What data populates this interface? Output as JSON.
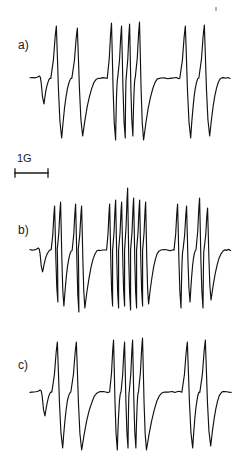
{
  "figure": {
    "type": "epr-derivative-spectra-figure",
    "width": 244,
    "height": 466,
    "background_color": "#ffffff",
    "trace_color": "#111111",
    "panel_count": 3
  },
  "panels": [
    {
      "id": "a",
      "label": "a)",
      "label_x": 18,
      "label_y": 38,
      "plot_top": 14,
      "plot_height": 130,
      "baseline_y": 78
    },
    {
      "id": "b",
      "label": "b)",
      "label_x": 18,
      "label_y": 223,
      "plot_top": 186,
      "plot_height": 128,
      "baseline_y": 250
    },
    {
      "id": "c",
      "label": "c)",
      "label_x": 18,
      "label_y": 358,
      "plot_top": 332,
      "plot_height": 124,
      "baseline_y": 392
    }
  ],
  "scalebar": {
    "label": "1G",
    "x_start": 14,
    "x_end": 47,
    "y": 178,
    "cap_height": 8,
    "color": "#1a1a1a"
  },
  "artifact": {
    "name": "scan-speck",
    "x": 215,
    "y": 7
  },
  "chart_data": {
    "type": "line",
    "title": "",
    "subtitle": "",
    "xlabel": "",
    "ylabel": "",
    "legend": [],
    "grid": false,
    "axis_visible": false,
    "x_units": "gauss",
    "x_scale_reference": {
      "label": "1G",
      "pixels": 33
    },
    "series": [
      {
        "name": "a",
        "panel": "a",
        "baseline_y": 78,
        "x_start": 30,
        "x_end": 232,
        "line_count": 8,
        "lines": [
          {
            "x": 40,
            "up": 2,
            "down": 26,
            "width": 5.5,
            "tail": 10
          },
          {
            "x": 57,
            "up": 52,
            "down": 60,
            "width": 6.5,
            "tail": 13
          },
          {
            "x": 78,
            "up": 50,
            "down": 58,
            "width": 6.5,
            "tail": 16
          },
          {
            "x": 112,
            "up": 55,
            "down": 62,
            "width": 5.0,
            "tail": 7
          },
          {
            "x": 122,
            "up": 52,
            "down": 60,
            "width": 4.5,
            "tail": 6
          },
          {
            "x": 130,
            "up": 54,
            "down": 58,
            "width": 4.0,
            "tail": 6
          },
          {
            "x": 140,
            "up": 56,
            "down": 62,
            "width": 5.0,
            "tail": 16
          },
          {
            "x": 186,
            "up": 52,
            "down": 60,
            "width": 6.5,
            "tail": 14
          },
          {
            "x": 205,
            "up": 53,
            "down": 58,
            "width": 6.5,
            "tail": 12
          }
        ]
      },
      {
        "name": "b",
        "panel": "b",
        "baseline_y": 250,
        "x_start": 30,
        "x_end": 232,
        "line_count": 16,
        "lines": [
          {
            "x": 39,
            "up": 2,
            "down": 22,
            "width": 5.0,
            "tail": 8
          },
          {
            "x": 55,
            "up": 44,
            "down": 52,
            "width": 4.0,
            "tail": 3
          },
          {
            "x": 61,
            "up": 48,
            "down": 56,
            "width": 4.0,
            "tail": 9
          },
          {
            "x": 76,
            "up": 46,
            "down": 62,
            "width": 4.0,
            "tail": 3
          },
          {
            "x": 82,
            "up": 44,
            "down": 58,
            "width": 4.0,
            "tail": 14
          },
          {
            "x": 110,
            "up": 46,
            "down": 56,
            "width": 3.6,
            "tail": 3
          },
          {
            "x": 116,
            "up": 50,
            "down": 58,
            "width": 3.6,
            "tail": 3
          },
          {
            "x": 122,
            "up": 48,
            "down": 56,
            "width": 3.6,
            "tail": 3
          },
          {
            "x": 128,
            "up": 62,
            "down": 60,
            "width": 3.6,
            "tail": 3
          },
          {
            "x": 134,
            "up": 52,
            "down": 58,
            "width": 3.6,
            "tail": 3
          },
          {
            "x": 140,
            "up": 50,
            "down": 56,
            "width": 3.6,
            "tail": 3
          },
          {
            "x": 146,
            "up": 48,
            "down": 54,
            "width": 3.6,
            "tail": 12
          },
          {
            "x": 178,
            "up": 46,
            "down": 58,
            "width": 4.2,
            "tail": 3
          },
          {
            "x": 187,
            "up": 44,
            "down": 52,
            "width": 4.2,
            "tail": 9
          },
          {
            "x": 200,
            "up": 52,
            "down": 58,
            "width": 4.2,
            "tail": 3
          },
          {
            "x": 208,
            "up": 42,
            "down": 50,
            "width": 4.2,
            "tail": 14
          }
        ]
      },
      {
        "name": "c",
        "panel": "c",
        "baseline_y": 392,
        "x_start": 30,
        "x_end": 232,
        "line_count": 8,
        "lines": [
          {
            "x": 41,
            "up": 2,
            "down": 24,
            "width": 5.5,
            "tail": 10
          },
          {
            "x": 58,
            "up": 50,
            "down": 56,
            "width": 6.5,
            "tail": 13
          },
          {
            "x": 77,
            "up": 50,
            "down": 58,
            "width": 6.5,
            "tail": 18
          },
          {
            "x": 114,
            "up": 52,
            "down": 58,
            "width": 4.6,
            "tail": 5
          },
          {
            "x": 125,
            "up": 50,
            "down": 56,
            "width": 4.2,
            "tail": 5
          },
          {
            "x": 133,
            "up": 52,
            "down": 56,
            "width": 4.0,
            "tail": 5
          },
          {
            "x": 143,
            "up": 54,
            "down": 58,
            "width": 4.8,
            "tail": 18
          },
          {
            "x": 188,
            "up": 50,
            "down": 56,
            "width": 6.5,
            "tail": 14
          },
          {
            "x": 206,
            "up": 52,
            "down": 54,
            "width": 6.5,
            "tail": 12
          }
        ]
      }
    ]
  }
}
